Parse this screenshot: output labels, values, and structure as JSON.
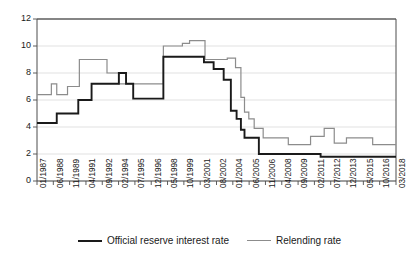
{
  "chart_data": {
    "type": "line",
    "title": "",
    "subtitle": "",
    "xlabel": "",
    "ylabel": "",
    "ylim": [
      0,
      12
    ],
    "yticks": [
      0,
      2,
      4,
      6,
      8,
      10,
      12
    ],
    "grid": true,
    "legend_position": "bottom-center",
    "line_style": "step",
    "colors": {
      "official": "#1a1a1a",
      "relending": "#8c8c8c",
      "grid": "#d9d9d9",
      "axis": "#4d4d4d",
      "background": "#ffffff"
    },
    "categories": [
      "01/1987",
      "06/1988",
      "11/1989",
      "04/1991",
      "09/1992",
      "02/1994",
      "07/1995",
      "12/1996",
      "05/1998",
      "10/1999",
      "03/2001",
      "08/2002",
      "01/2004",
      "06/2005",
      "11/2006",
      "04/2008",
      "09/2009",
      "02/2011",
      "07/2012",
      "12/2013",
      "05/2015",
      "10/2016",
      "03/2018"
    ],
    "series": [
      {
        "name": "Official reserve interest rate",
        "color": "#1a1a1a",
        "points": [
          [
            0.0,
            4.3
          ],
          [
            0.055,
            4.3
          ],
          [
            0.055,
            5.0
          ],
          [
            0.115,
            5.0
          ],
          [
            0.115,
            6.0
          ],
          [
            0.152,
            6.0
          ],
          [
            0.152,
            7.2
          ],
          [
            0.205,
            7.2
          ],
          [
            0.205,
            7.2
          ],
          [
            0.228,
            7.2
          ],
          [
            0.228,
            8.0
          ],
          [
            0.248,
            8.0
          ],
          [
            0.248,
            7.2
          ],
          [
            0.268,
            7.2
          ],
          [
            0.268,
            6.1
          ],
          [
            0.352,
            6.1
          ],
          [
            0.352,
            9.2
          ],
          [
            0.465,
            9.2
          ],
          [
            0.465,
            8.8
          ],
          [
            0.492,
            8.8
          ],
          [
            0.492,
            8.3
          ],
          [
            0.52,
            8.3
          ],
          [
            0.52,
            7.5
          ],
          [
            0.54,
            7.5
          ],
          [
            0.54,
            5.2
          ],
          [
            0.556,
            5.2
          ],
          [
            0.556,
            4.6
          ],
          [
            0.568,
            4.6
          ],
          [
            0.568,
            3.8
          ],
          [
            0.578,
            3.8
          ],
          [
            0.578,
            3.2
          ],
          [
            0.618,
            3.2
          ],
          [
            0.618,
            2.0
          ],
          [
            0.79,
            2.0
          ],
          [
            0.79,
            1.8
          ],
          [
            1.0,
            1.8
          ]
        ],
        "values_readout": [
          4.3,
          5.0,
          6.0,
          7.2,
          8.0,
          6.1,
          9.2,
          8.8,
          8.3,
          7.5,
          5.2,
          3.8,
          3.2,
          2.0,
          1.8
        ]
      },
      {
        "name": "Relending rate",
        "color": "#8c8c8c",
        "points": [
          [
            0.0,
            6.4
          ],
          [
            0.04,
            6.4
          ],
          [
            0.04,
            7.2
          ],
          [
            0.055,
            7.2
          ],
          [
            0.055,
            6.4
          ],
          [
            0.085,
            6.4
          ],
          [
            0.085,
            7.0
          ],
          [
            0.118,
            7.0
          ],
          [
            0.118,
            9.0
          ],
          [
            0.195,
            9.0
          ],
          [
            0.195,
            8.0
          ],
          [
            0.228,
            8.0
          ],
          [
            0.228,
            7.2
          ],
          [
            0.352,
            7.2
          ],
          [
            0.352,
            10.0
          ],
          [
            0.405,
            10.0
          ],
          [
            0.405,
            10.2
          ],
          [
            0.425,
            10.2
          ],
          [
            0.425,
            10.4
          ],
          [
            0.468,
            10.4
          ],
          [
            0.468,
            9.0
          ],
          [
            0.53,
            9.0
          ],
          [
            0.53,
            9.1
          ],
          [
            0.553,
            9.1
          ],
          [
            0.553,
            8.4
          ],
          [
            0.568,
            8.4
          ],
          [
            0.568,
            6.2
          ],
          [
            0.578,
            6.2
          ],
          [
            0.578,
            5.1
          ],
          [
            0.59,
            5.1
          ],
          [
            0.59,
            4.6
          ],
          [
            0.605,
            4.6
          ],
          [
            0.605,
            3.9
          ],
          [
            0.63,
            3.9
          ],
          [
            0.63,
            3.2
          ],
          [
            0.7,
            3.2
          ],
          [
            0.7,
            2.7
          ],
          [
            0.762,
            2.7
          ],
          [
            0.762,
            3.3
          ],
          [
            0.8,
            3.3
          ],
          [
            0.8,
            3.9
          ],
          [
            0.828,
            3.9
          ],
          [
            0.828,
            2.8
          ],
          [
            0.862,
            2.8
          ],
          [
            0.862,
            3.2
          ],
          [
            0.935,
            3.2
          ],
          [
            0.935,
            2.7
          ],
          [
            1.0,
            2.7
          ]
        ],
        "values_readout": [
          6.4,
          7.2,
          6.4,
          7.0,
          9.0,
          8.0,
          7.2,
          10.0,
          10.2,
          10.4,
          9.0,
          9.1,
          8.4,
          6.2,
          5.1,
          4.6,
          3.9,
          3.2,
          2.7,
          3.3,
          3.9,
          2.8,
          3.2,
          2.7
        ]
      }
    ]
  },
  "legend": {
    "entries": [
      {
        "label": "Official reserve interest rate",
        "style": "official"
      },
      {
        "label": "Relending rate",
        "style": "relend"
      }
    ]
  }
}
